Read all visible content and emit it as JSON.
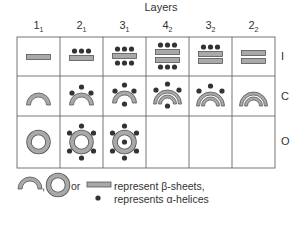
{
  "title": "Layers",
  "columns": [
    {
      "main": "1",
      "sub": "1"
    },
    {
      "main": "2",
      "sub": "1"
    },
    {
      "main": "3",
      "sub": "1"
    },
    {
      "main": "4",
      "sub": "2"
    },
    {
      "main": "3",
      "sub": "2"
    },
    {
      "main": "2",
      "sub": "2"
    }
  ],
  "rows": [
    {
      "label": "I"
    },
    {
      "label": "C"
    },
    {
      "label": "O"
    }
  ],
  "cells": {
    "I": [
      "1 sheet",
      "1 sheet + 3 helices above",
      "1 sheet + 3 helices above + 3 below",
      "2 sheets + 3 helices above + 3 below",
      "2 sheets + 3 helices above",
      "2 sheets"
    ],
    "C": [
      "1 arc",
      "1 arc + 3 helices outside",
      "1 arc + 3 outside + 1 inside",
      "2 arcs + 3 outside + 1 inside",
      "2 arcs + 3 outside",
      "2 arcs"
    ],
    "O": [
      "1 ring",
      "1 ring + 8 helices outside",
      "1 ring + 8 outside + 1 inside",
      "",
      "",
      ""
    ]
  },
  "legend": {
    "separator_comma": ",",
    "or_text": "or",
    "beta_text": "represent β-sheets,",
    "alpha_text": "represents α-helices"
  },
  "colors": {
    "sheet_fill": "#a9a9a9",
    "sheet_stroke": "#555555",
    "helix": "#333333",
    "grid": "#666666"
  }
}
